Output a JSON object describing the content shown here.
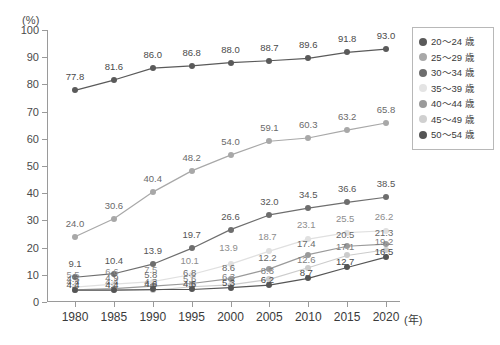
{
  "axis_unit_label": "(%)",
  "x_unit_label": "(年)",
  "legend": {
    "items": [
      {
        "label": "20～24 歳",
        "color": "#5a5a5a"
      },
      {
        "label": "25～29 歳",
        "color": "#a8a8a8"
      },
      {
        "label": "30～34 歳",
        "color": "#6e6e6e"
      },
      {
        "label": "35～39 歳",
        "color": "#e4e4e4"
      },
      {
        "label": "40～44 歳",
        "color": "#9a9a9a"
      },
      {
        "label": "45～49 歳",
        "color": "#d0d0d0"
      },
      {
        "label": "50～54 歳",
        "color": "#555555"
      }
    ]
  },
  "chart_data": {
    "type": "line",
    "title": "",
    "xlabel": "(年)",
    "ylabel": "(%)",
    "ylim": [
      0,
      100
    ],
    "yticks": [
      0,
      10,
      20,
      30,
      40,
      50,
      60,
      70,
      80,
      90,
      100
    ],
    "grid": false,
    "legend_position": "right",
    "categories": [
      "1980",
      "1985",
      "1990",
      "1995",
      "2000",
      "2005",
      "2010",
      "2015",
      "2020"
    ],
    "series": [
      {
        "name": "20～24 歳",
        "color": "#5a5a5a",
        "label_color": "#4a4a4a",
        "values": [
          77.8,
          81.6,
          86.0,
          86.8,
          88.0,
          88.7,
          89.6,
          91.8,
          93.0
        ]
      },
      {
        "name": "25～29 歳",
        "color": "#a8a8a8",
        "label_color": "#6a6a6a",
        "values": [
          24.0,
          30.6,
          40.4,
          48.2,
          54.0,
          59.1,
          60.3,
          63.2,
          65.8
        ]
      },
      {
        "name": "30～34 歳",
        "color": "#6e6e6e",
        "label_color": "#555555",
        "values": [
          9.1,
          10.4,
          13.9,
          19.7,
          26.6,
          32.0,
          34.5,
          36.6,
          38.5
        ]
      },
      {
        "name": "35～39 歳",
        "color": "#e0e0e0",
        "label_color": "#8d8d8d",
        "values": [
          5.5,
          6.6,
          7.5,
          10.1,
          13.9,
          18.7,
          23.1,
          25.5,
          26.2
        ]
      },
      {
        "name": "40～44 歳",
        "color": "#9a9a9a",
        "label_color": "#6a6a6a",
        "values": [
          4.5,
          4.9,
          5.8,
          6.8,
          8.6,
          12.2,
          17.4,
          20.5,
          21.3
        ]
      },
      {
        "name": "45～49 歳",
        "color": "#cccccc",
        "label_color": "#7d7d7d",
        "values": [
          4.4,
          4.4,
          4.3,
          5.6,
          6.3,
          8.3,
          12.6,
          17.1,
          19.2
        ]
      },
      {
        "name": "50～54 歳",
        "color": "#555555",
        "label_color": "#4a4a4a",
        "values": [
          4.4,
          4.4,
          4.6,
          4.6,
          5.3,
          6.2,
          8.7,
          12.7,
          16.5
        ]
      }
    ],
    "label_offsets": {
      "20～24 歳": [
        [
          0,
          -9
        ],
        [
          0,
          -9
        ],
        [
          0,
          -9
        ],
        [
          0,
          -9
        ],
        [
          0,
          -9
        ],
        [
          0,
          -9
        ],
        [
          0,
          -9
        ],
        [
          0,
          -9
        ],
        [
          0,
          -9
        ]
      ],
      "25～29 歳": [
        [
          0,
          -9
        ],
        [
          0,
          -9
        ],
        [
          0,
          -9
        ],
        [
          0,
          -9
        ],
        [
          0,
          -9
        ],
        [
          0,
          -9
        ],
        [
          0,
          -9
        ],
        [
          0,
          -9
        ],
        [
          0,
          -9
        ]
      ],
      "30～34 歳": [
        [
          0,
          -9
        ],
        [
          0,
          -9
        ],
        [
          0,
          -9
        ],
        [
          0,
          -9
        ],
        [
          0,
          -9
        ],
        [
          0,
          -9
        ],
        [
          0,
          -9
        ],
        [
          0,
          -9
        ],
        [
          0,
          -9
        ]
      ],
      "35～39 歳": [
        [
          -2,
          -8
        ],
        [
          -2,
          -8
        ],
        [
          -2,
          -8
        ],
        [
          -2,
          -10
        ],
        [
          -2,
          -12
        ],
        [
          -2,
          -10
        ],
        [
          -2,
          -10
        ],
        [
          -2,
          -10
        ],
        [
          -2,
          -10
        ]
      ],
      "40～44 歳": [
        [
          -2,
          -7
        ],
        [
          -2,
          -7
        ],
        [
          -2,
          -7
        ],
        [
          -2,
          -7
        ],
        [
          -2,
          -7
        ],
        [
          -2,
          -7
        ],
        [
          -2,
          -7
        ],
        [
          -2,
          -7
        ],
        [
          -2,
          -7
        ]
      ],
      "45～49 歳": [
        [
          -2,
          -4
        ],
        [
          -2,
          -4
        ],
        [
          -2,
          -4
        ],
        [
          -2,
          -4
        ],
        [
          -2,
          -4
        ],
        [
          -2,
          -4
        ],
        [
          -2,
          -4
        ],
        [
          -2,
          -4
        ],
        [
          -2,
          -4
        ]
      ],
      "50～54 歳": [
        [
          -2,
          -1
        ],
        [
          -2,
          -1
        ],
        [
          -2,
          -1
        ],
        [
          -2,
          -1
        ],
        [
          -2,
          -1
        ],
        [
          -2,
          -1
        ],
        [
          -2,
          -1
        ],
        [
          -2,
          -1
        ],
        [
          -2,
          -1
        ]
      ]
    }
  }
}
